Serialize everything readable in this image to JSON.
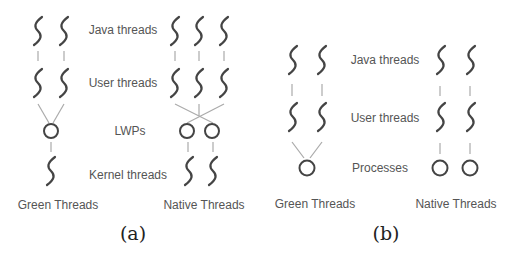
{
  "figure": {
    "panel_a": {
      "caption": "(a)",
      "row_labels": {
        "java": "Java threads",
        "user": "User threads",
        "lwp": "LWPs",
        "kernel": "Kernel threads"
      },
      "group_labels": {
        "green": "Green Threads",
        "native": "Native Threads"
      }
    },
    "panel_b": {
      "caption": "(b)",
      "row_labels": {
        "java": "Java threads",
        "user": "User threads",
        "process": "Processes"
      },
      "group_labels": {
        "green": "Green Threads",
        "native": "Native Threads"
      }
    },
    "colors": {
      "thread_stroke": "#444444",
      "connector": "#aaaaaa",
      "label_text": "#555555",
      "caption_text": "#222222"
    }
  }
}
